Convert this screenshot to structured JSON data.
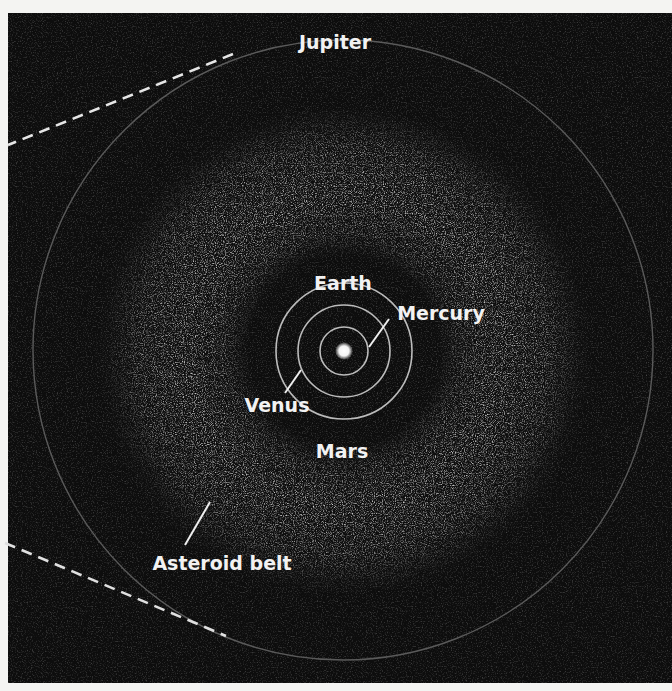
{
  "diagram": {
    "colors": {
      "background_page": "#f4f4f2",
      "panel": "#0d0d0d",
      "label": "#f2f2f2",
      "orbit_inner": "#b8b8b8",
      "orbit_jupiter": "#5a5a5a",
      "belt": "#8a8a8a",
      "dash": "#e6e6e6"
    },
    "center": {
      "x": 344,
      "y": 351
    },
    "sun": {
      "label": "Sun",
      "radius": 7
    },
    "orbits": [
      {
        "name": "Mercury",
        "radius": 24
      },
      {
        "name": "Venus",
        "radius": 46
      },
      {
        "name": "Earth",
        "radius": 68
      },
      {
        "name": "Jupiter",
        "radius": 310
      }
    ],
    "asteroid_belt": {
      "inner_radius": 110,
      "outer_radius": 232
    },
    "labels": {
      "jupiter": "Jupiter",
      "earth": "Earth",
      "mercury": "Mercury",
      "venus": "Venus",
      "mars": "Mars",
      "asteroid_belt": "Asteroid belt"
    }
  }
}
